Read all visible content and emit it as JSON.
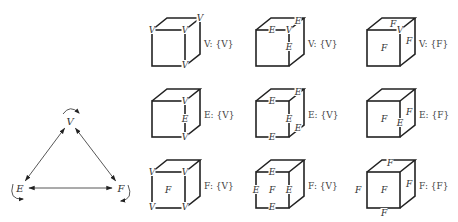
{
  "triangle": {
    "nodes": [
      {
        "id": "V",
        "label": "V",
        "x": 70,
        "y": 125
      },
      {
        "id": "E",
        "label": "E",
        "x": 20,
        "y": 192
      },
      {
        "id": "F",
        "label": "F",
        "x": 121,
        "y": 192
      }
    ],
    "edges": [
      {
        "from": "V",
        "to": "E",
        "bidirectional": true
      },
      {
        "from": "V",
        "to": "F",
        "bidirectional": true
      },
      {
        "from": "E",
        "to": "F",
        "bidirectional": true
      }
    ],
    "self_loops": [
      "V",
      "E",
      "F"
    ]
  },
  "cube": {
    "front_width": 33,
    "front_height": 36,
    "depth_dx": 15,
    "depth_dy": -12
  },
  "grid": {
    "columns_x": [
      152,
      256,
      367
    ],
    "rows_y": [
      30,
      101,
      172
    ]
  },
  "cells": [
    {
      "row": 0,
      "col": 0,
      "caption": "V: {V}",
      "labels": [
        {
          "t": "V",
          "x": 152,
          "y": 33
        },
        {
          "t": "V",
          "x": 185,
          "y": 33
        },
        {
          "t": "V",
          "x": 200,
          "y": 21
        },
        {
          "t": "V",
          "x": 185,
          "y": 68
        }
      ]
    },
    {
      "row": 0,
      "col": 1,
      "caption": "V: {V}",
      "labels": [
        {
          "t": "E",
          "x": 272,
          "y": 33
        },
        {
          "t": "V",
          "x": 289,
          "y": 33
        },
        {
          "t": "E",
          "x": 298,
          "y": 24
        },
        {
          "t": "E",
          "x": 289,
          "y": 50
        }
      ]
    },
    {
      "row": 0,
      "col": 2,
      "caption": "V: {F}",
      "labels": [
        {
          "t": "F",
          "x": 384,
          "y": 51
        },
        {
          "t": "F",
          "x": 393,
          "y": 27
        },
        {
          "t": "V",
          "x": 400,
          "y": 33
        },
        {
          "t": "F",
          "x": 409,
          "y": 44
        }
      ]
    },
    {
      "row": 1,
      "col": 0,
      "caption": "E: {V}",
      "labels": [
        {
          "t": "V",
          "x": 185,
          "y": 104
        },
        {
          "t": "E",
          "x": 185,
          "y": 122
        },
        {
          "t": "V",
          "x": 185,
          "y": 140
        }
      ]
    },
    {
      "row": 1,
      "col": 1,
      "caption": "E: {V}",
      "labels": [
        {
          "t": "E",
          "x": 272,
          "y": 104
        },
        {
          "t": "E",
          "x": 298,
          "y": 95
        },
        {
          "t": "E",
          "x": 289,
          "y": 122
        },
        {
          "t": "E",
          "x": 272,
          "y": 140
        },
        {
          "t": "E",
          "x": 298,
          "y": 131
        }
      ]
    },
    {
      "row": 1,
      "col": 2,
      "caption": "E: {F}",
      "labels": [
        {
          "t": "F",
          "x": 384,
          "y": 122
        },
        {
          "t": "E",
          "x": 400,
          "y": 126
        },
        {
          "t": "F",
          "x": 409,
          "y": 115
        }
      ]
    },
    {
      "row": 2,
      "col": 0,
      "caption": "F: {V}",
      "labels": [
        {
          "t": "V",
          "x": 152,
          "y": 175
        },
        {
          "t": "V",
          "x": 185,
          "y": 175
        },
        {
          "t": "F",
          "x": 168,
          "y": 193
        },
        {
          "t": "V",
          "x": 152,
          "y": 210
        },
        {
          "t": "V",
          "x": 185,
          "y": 210
        }
      ]
    },
    {
      "row": 2,
      "col": 1,
      "caption": "F: {V}",
      "labels": [
        {
          "t": "E",
          "x": 272,
          "y": 175
        },
        {
          "t": "E",
          "x": 256,
          "y": 193
        },
        {
          "t": "F",
          "x": 272,
          "y": 193
        },
        {
          "t": "E",
          "x": 289,
          "y": 193
        },
        {
          "t": "E",
          "x": 272,
          "y": 210
        }
      ]
    },
    {
      "row": 2,
      "col": 2,
      "caption": "F: {F}",
      "labels": [
        {
          "t": "F",
          "x": 390,
          "y": 166
        },
        {
          "t": "F",
          "x": 358,
          "y": 193
        },
        {
          "t": "F",
          "x": 384,
          "y": 193
        },
        {
          "t": "F",
          "x": 409,
          "y": 187
        },
        {
          "t": "F",
          "x": 384,
          "y": 216
        }
      ]
    }
  ]
}
